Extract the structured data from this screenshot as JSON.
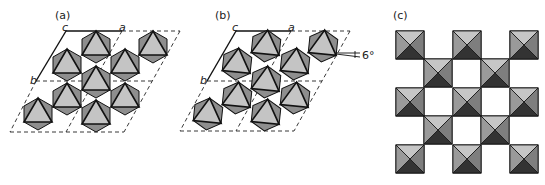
{
  "panels": [
    {
      "id": "a",
      "label": "(a)",
      "axes": {
        "c": "c",
        "a": "a",
        "b": "b"
      },
      "description": "Hexagonal layer of corner-sharing octahedra, untilted"
    },
    {
      "id": "b",
      "label": "(b)",
      "axes": {
        "c": "c",
        "a": "a",
        "b": "b"
      },
      "tilt_angle": "6°",
      "description": "Same layer with octahedra rotated by 6°"
    },
    {
      "id": "c",
      "label": "(c)",
      "description": "Square checkerboard network of corner-sharing octahedra"
    }
  ],
  "colors": {
    "face_light": "#c4c4c4",
    "face_mid": "#8e8e8e",
    "face_dark": "#3a3a3a",
    "edge": "#111111",
    "dashed": "#222222"
  }
}
